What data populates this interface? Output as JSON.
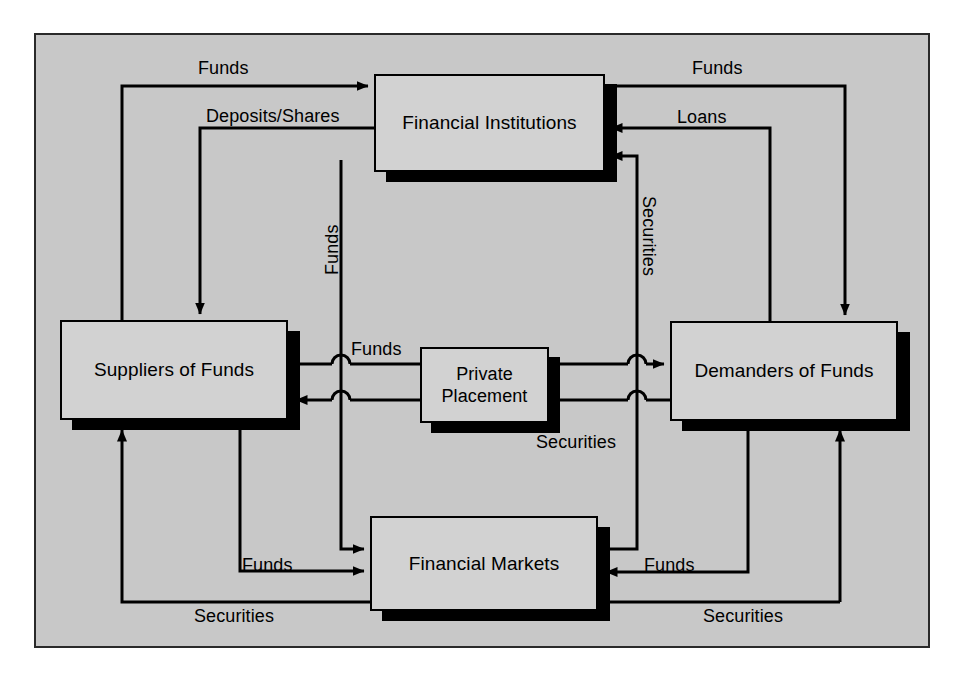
{
  "diagram": {
    "background_color": "#c8c8c8",
    "node_fill_color": "#d2d2d2",
    "line_color": "#000000",
    "nodes": [
      {
        "id": "financial-institutions",
        "label": "Financial Institutions"
      },
      {
        "id": "suppliers-of-funds",
        "label": "Suppliers of Funds"
      },
      {
        "id": "private-placement",
        "label": "Private Placement",
        "line1": "Private",
        "line2": "Placement"
      },
      {
        "id": "demanders-of-funds",
        "label": "Demanders of Funds"
      },
      {
        "id": "financial-markets",
        "label": "Financial Markets"
      }
    ],
    "edge_labels": {
      "top_left_funds": "Funds",
      "deposits_shares": "Deposits/Shares",
      "top_right_funds": "Funds",
      "loans": "Loans",
      "vertical_funds": "Funds",
      "vertical_securities": "Securities",
      "center_funds": "Funds",
      "center_securities": "Securities",
      "bottom_left_funds": "Funds",
      "bottom_left_securities": "Securities",
      "bottom_right_funds": "Funds",
      "bottom_right_securities": "Securities"
    }
  }
}
